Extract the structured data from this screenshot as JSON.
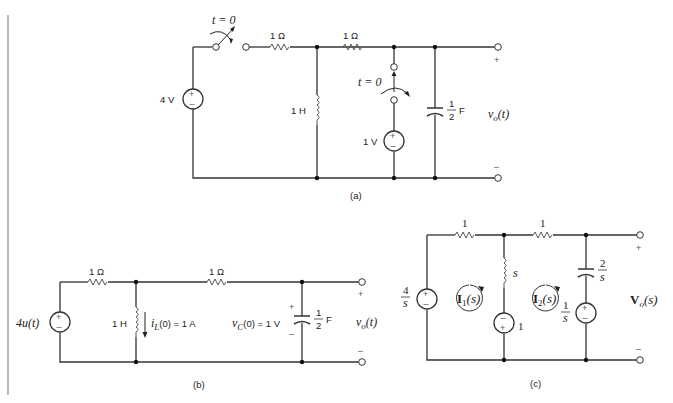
{
  "figure": {
    "left_rule_color": "#888888",
    "panels": [
      {
        "id": "a",
        "caption": "(a)",
        "labels": {
          "switch1": "t = 0",
          "r1": "1 Ω",
          "r2": "1 Ω",
          "source_left": "4 V",
          "inductor": "1 H",
          "switch2": "t = 0",
          "source_mid": "1 V",
          "cap_num": "1",
          "cap_den": "2",
          "cap_unit": "F",
          "output": "v",
          "output_sub": "o",
          "output_arg": "(t)",
          "plus": "+",
          "minus": "–"
        }
      },
      {
        "id": "b",
        "caption": "(b)",
        "labels": {
          "source": "4u(t)",
          "r1": "1 Ω",
          "r2": "1 Ω",
          "inductor": "1 H",
          "il_init": "i",
          "il_sub": "L",
          "il_rest": "(0) = 1 A",
          "vc_init": "v",
          "vc_sub": "C",
          "vc_rest": "(0) = 1 V",
          "cap_num": "1",
          "cap_den": "2",
          "cap_unit": "F",
          "output": "v",
          "output_sub": "o",
          "output_arg": "(t)",
          "plus": "+",
          "minus": "–"
        }
      },
      {
        "id": "c",
        "caption": "(c)",
        "labels": {
          "source_left_num": "4",
          "source_left_den": "s",
          "r1": "1",
          "r2": "1",
          "inductor": "s",
          "source_mid": "1",
          "mesh1": "I",
          "mesh1_sub": "1",
          "mesh1_arg": "(s)",
          "mesh2": "I",
          "mesh2_sub": "2",
          "mesh2_arg": "(s)",
          "cap_num": "2",
          "cap_den": "s",
          "source_right_num": "1",
          "source_right_den": "s",
          "output": "V",
          "output_sub": "o",
          "output_arg": "(s)",
          "plus": "+",
          "minus": "–"
        }
      }
    ]
  }
}
